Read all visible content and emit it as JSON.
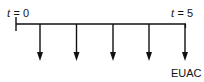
{
  "diagram": {
    "type": "cash-flow-timeline",
    "start_label": {
      "var": "t",
      "eq": " = 0"
    },
    "end_label": {
      "var": "t",
      "eq": " = 5"
    },
    "arrow_direction": "down",
    "arrow_count": 5,
    "arrow_label": "EUAC",
    "line_color": "#111111"
  }
}
